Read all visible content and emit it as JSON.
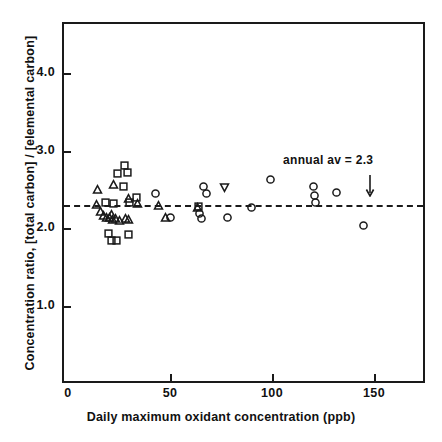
{
  "chart_data": {
    "type": "scatter",
    "title": "",
    "xlabel": "Daily maximum oxidant concentration (ppb)",
    "ylabel": "Concentration ratio, [total carbon] / [elemental carbon]",
    "xlim": [
      0,
      176
    ],
    "ylim": [
      0,
      4.66
    ],
    "xticks": [
      0,
      50,
      100,
      150
    ],
    "xtick_labels": [
      "0",
      "50",
      "100",
      "150"
    ],
    "yticks": [
      1.0,
      2.0,
      3.0,
      4.0
    ],
    "ytick_labels": [
      "1.0",
      "2.0",
      "3.0",
      "4.0"
    ],
    "grid": false,
    "legend": null,
    "annotations": [
      {
        "name": "annual-average-label",
        "text": "annual av  =  2.3",
        "x": 128,
        "y": 2.86
      },
      {
        "name": "annual-average-arrow",
        "symbol": "down-arrow",
        "x": 148,
        "y": 2.55
      }
    ],
    "reference_line": {
      "name": "annual-average-line",
      "style": "dashed",
      "orientation": "horizontal",
      "value": 2.3,
      "label": "annual av = 2.3"
    },
    "series": [
      {
        "name": "triangle-up",
        "marker": "triangle-up",
        "points": [
          [
            14.5,
            2.5
          ],
          [
            14.0,
            2.3
          ],
          [
            16.0,
            2.21
          ],
          [
            17.5,
            2.16
          ],
          [
            19.0,
            2.14
          ],
          [
            20.5,
            2.13
          ],
          [
            22.0,
            2.11
          ],
          [
            23.5,
            2.12
          ],
          [
            25.0,
            2.1
          ],
          [
            22.5,
            2.56
          ],
          [
            21.5,
            2.18
          ],
          [
            29.5,
            2.38
          ],
          [
            28.0,
            2.12
          ],
          [
            29.5,
            2.11
          ],
          [
            34.0,
            2.31
          ],
          [
            44.5,
            2.29
          ],
          [
            48.0,
            2.14
          ],
          [
            63.5,
            2.26
          ]
        ]
      },
      {
        "name": "square",
        "marker": "square",
        "points": [
          [
            18.5,
            2.33
          ],
          [
            22.5,
            2.32
          ],
          [
            24.5,
            2.7
          ],
          [
            27.5,
            2.81
          ],
          [
            29.0,
            2.71
          ],
          [
            27.0,
            2.54
          ],
          [
            30.0,
            2.33
          ],
          [
            33.5,
            2.39
          ],
          [
            20.0,
            1.93
          ],
          [
            21.5,
            1.84
          ],
          [
            24.0,
            1.84
          ],
          [
            29.5,
            1.92
          ],
          [
            64.0,
            2.28
          ]
        ]
      },
      {
        "name": "circle",
        "marker": "circle",
        "points": [
          [
            43.0,
            2.45
          ],
          [
            50.0,
            2.13
          ],
          [
            64.5,
            2.19
          ],
          [
            65.5,
            2.12
          ],
          [
            66.5,
            2.53
          ],
          [
            68.0,
            2.44
          ],
          [
            78.0,
            2.14
          ],
          [
            90.0,
            2.26
          ],
          [
            99.5,
            2.63
          ],
          [
            120.5,
            2.54
          ],
          [
            121.0,
            2.42
          ],
          [
            121.5,
            2.33
          ],
          [
            131.5,
            2.46
          ],
          [
            145.0,
            2.03
          ]
        ]
      },
      {
        "name": "triangle-down",
        "marker": "triangle-down",
        "points": [
          [
            76.5,
            2.52
          ]
        ]
      }
    ]
  },
  "colors": {
    "ink": "#1a1a1a",
    "background": "#ffffff"
  }
}
